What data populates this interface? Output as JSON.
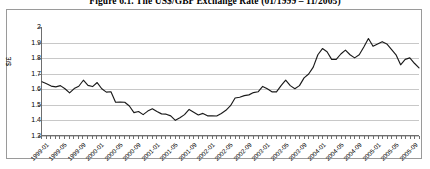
{
  "figure": {
    "title": "Figure 6.1. The US$/GBP Exchange Rate (01/1999 – 11/2005)"
  },
  "chart_data": {
    "type": "line",
    "title": "Figure 6.1. The US$/GBP Exchange Rate (01/1999 – 11/2005)",
    "xlabel": "",
    "ylabel": "$/£",
    "ylim": [
      1.3,
      2.0
    ],
    "yticks": [
      "2",
      "1.9",
      "1.8",
      "1.7",
      "1.6",
      "1.5",
      "1.4",
      "1.3"
    ],
    "ytick_values": [
      2.0,
      1.9,
      1.8,
      1.7,
      1.6,
      1.5,
      1.4,
      1.3
    ],
    "grid": true,
    "legend": "none",
    "line_color": "#1a1a1a",
    "xtick_labels": [
      "1999-01",
      "1999-05",
      "1999-09",
      "2000-01",
      "2000-05",
      "2000-09",
      "2001-01",
      "2001-05",
      "2001-09",
      "2002-01",
      "2002-05",
      "2002-09",
      "2003-01",
      "2003-05",
      "2003-09",
      "2004-01",
      "2004-05",
      "2004-09",
      "2005-01",
      "2005-05",
      "2005-09"
    ],
    "x": [
      "1999-01",
      "1999-02",
      "1999-03",
      "1999-04",
      "1999-05",
      "1999-06",
      "1999-07",
      "1999-08",
      "1999-09",
      "1999-10",
      "1999-11",
      "1999-12",
      "2000-01",
      "2000-02",
      "2000-03",
      "2000-04",
      "2000-05",
      "2000-06",
      "2000-07",
      "2000-08",
      "2000-09",
      "2000-10",
      "2000-11",
      "2000-12",
      "2001-01",
      "2001-02",
      "2001-03",
      "2001-04",
      "2001-05",
      "2001-06",
      "2001-07",
      "2001-08",
      "2001-09",
      "2001-10",
      "2001-11",
      "2001-12",
      "2002-01",
      "2002-02",
      "2002-03",
      "2002-04",
      "2002-05",
      "2002-06",
      "2002-07",
      "2002-08",
      "2002-09",
      "2002-10",
      "2002-11",
      "2002-12",
      "2003-01",
      "2003-02",
      "2003-03",
      "2003-04",
      "2003-05",
      "2003-06",
      "2003-07",
      "2003-08",
      "2003-09",
      "2003-10",
      "2003-11",
      "2003-12",
      "2004-01",
      "2004-02",
      "2004-03",
      "2004-04",
      "2004-05",
      "2004-06",
      "2004-07",
      "2004-08",
      "2004-09",
      "2004-10",
      "2004-11",
      "2004-12",
      "2005-01",
      "2005-02",
      "2005-03",
      "2005-04",
      "2005-05",
      "2005-06",
      "2005-07",
      "2005-08",
      "2005-09",
      "2005-10",
      "2005-11"
    ],
    "values": [
      1.645,
      1.632,
      1.617,
      1.612,
      1.62,
      1.6,
      1.573,
      1.601,
      1.616,
      1.655,
      1.622,
      1.614,
      1.64,
      1.6,
      1.578,
      1.58,
      1.512,
      1.513,
      1.512,
      1.488,
      1.445,
      1.452,
      1.432,
      1.455,
      1.47,
      1.452,
      1.437,
      1.435,
      1.424,
      1.395,
      1.412,
      1.432,
      1.466,
      1.448,
      1.43,
      1.44,
      1.424,
      1.424,
      1.423,
      1.44,
      1.46,
      1.49,
      1.54,
      1.545,
      1.555,
      1.56,
      1.575,
      1.58,
      1.615,
      1.6,
      1.58,
      1.58,
      1.62,
      1.655,
      1.62,
      1.6,
      1.62,
      1.67,
      1.695,
      1.74,
      1.82,
      1.86,
      1.84,
      1.79,
      1.79,
      1.825,
      1.85,
      1.82,
      1.8,
      1.82,
      1.87,
      1.925,
      1.875,
      1.89,
      1.905,
      1.89,
      1.855,
      1.82,
      1.755,
      1.79,
      1.8,
      1.765,
      1.735
    ]
  }
}
